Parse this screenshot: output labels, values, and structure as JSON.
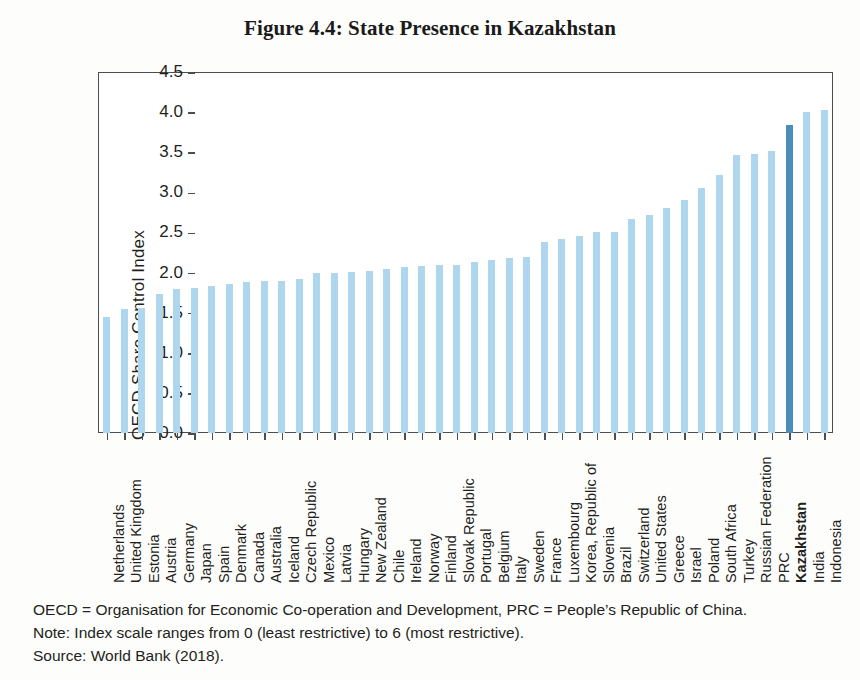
{
  "chart_data": {
    "type": "bar",
    "title": "Figure 4.4: State Presence in Kazakhstan",
    "xlabel": "",
    "ylabel": "OECD Share Control Index",
    "ylim": [
      0.0,
      4.5
    ],
    "ytick_labels": [
      "0.0",
      "0.5",
      "1.0",
      "1.5",
      "2.0",
      "2.5",
      "3.0",
      "3.5",
      "4.0",
      "4.5"
    ],
    "ytick_values": [
      0.0,
      0.5,
      1.0,
      1.5,
      2.0,
      2.5,
      3.0,
      3.5,
      4.0,
      4.5
    ],
    "grid": false,
    "legend": "none",
    "bar_color": "#aed6ee",
    "highlight_color": "#4b8dba",
    "highlight_category": "Kazakhstan",
    "categories": [
      "Netherlands",
      "United Kingdom",
      "Estonia",
      "Austria",
      "Germany",
      "Japan",
      "Spain",
      "Denmark",
      "Canada",
      "Australia",
      "Iceland",
      "Czech Republic",
      "Mexico",
      "Latvia",
      "Hungary",
      "New Zealand",
      "Chile",
      "Ireland",
      "Norway",
      "Finland",
      "Slovak Republic",
      "Portugal",
      "Belgium",
      "Italy",
      "Sweden",
      "France",
      "Luxembourg",
      "Korea, Republic of",
      "Slovenia",
      "Brazil",
      "Switzerland",
      "United States",
      "Greece",
      "Israel",
      "Poland",
      "South Africa",
      "Turkey",
      "Russian Federation",
      "PRC",
      "Kazakhstan",
      "India",
      "Indonesia"
    ],
    "values": [
      1.45,
      1.54,
      1.56,
      1.73,
      1.79,
      1.81,
      1.83,
      1.86,
      1.88,
      1.89,
      1.9,
      1.92,
      1.99,
      2.0,
      2.01,
      2.02,
      2.04,
      2.07,
      2.08,
      2.09,
      2.1,
      2.13,
      2.16,
      2.18,
      2.2,
      2.38,
      2.42,
      2.46,
      2.5,
      2.51,
      2.67,
      2.72,
      2.8,
      2.91,
      3.05,
      3.22,
      3.47,
      3.48,
      3.52,
      3.84,
      4.0,
      4.03
    ]
  },
  "footnotes": {
    "line1": "OECD = Organisation for Economic Co-operation and Development, PRC = People’s Republic of China.",
    "line2": "Note: Index scale ranges from 0 (least restrictive) to 6 (most restrictive).",
    "line3": "Source: World Bank (2018)."
  }
}
